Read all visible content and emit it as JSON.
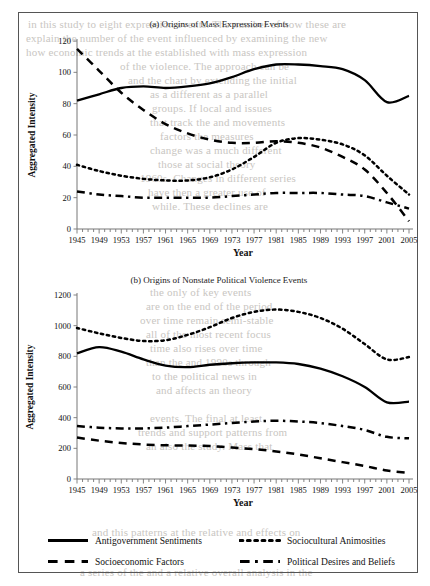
{
  "document": {
    "bleed_lines": [
      {
        "text": "in this study to eight expression events. The number of how these are",
        "x": 28,
        "y": 18
      },
      {
        "text": "explain the number of the event influenced by examining the new",
        "x": 26,
        "y": 32
      },
      {
        "text": "how economic trends at the established with mass expression",
        "x": 26,
        "y": 46
      },
      {
        "text": "of the violence. The approach can be",
        "x": 120,
        "y": 60
      },
      {
        "text": "and the chart by extending the initial",
        "x": 128,
        "y": 74
      },
      {
        "text": "as a different as a parallel",
        "x": 150,
        "y": 88
      },
      {
        "text": "groups. If local and issues",
        "x": 152,
        "y": 102
      },
      {
        "text": "that track the and movements",
        "x": 150,
        "y": 116
      },
      {
        "text": "factors the measures",
        "x": 160,
        "y": 130
      },
      {
        "text": "change was a much different",
        "x": 150,
        "y": 144
      },
      {
        "text": "those at social theory",
        "x": 158,
        "y": 158
      },
      {
        "text": "1960s. Changes in different series",
        "x": 140,
        "y": 172
      },
      {
        "text": "have then a greater use of",
        "x": 148,
        "y": 186
      },
      {
        "text": "while. These declines are",
        "x": 152,
        "y": 200
      },
      {
        "text": "the only of key events",
        "x": 150,
        "y": 286
      },
      {
        "text": "are on the end of the period",
        "x": 146,
        "y": 300
      },
      {
        "text": "over time remain semi-stable",
        "x": 140,
        "y": 314
      },
      {
        "text": "all of the most recent focus",
        "x": 146,
        "y": 328
      },
      {
        "text": "time also rises over time",
        "x": 150,
        "y": 342
      },
      {
        "text": "than the and 1990s through",
        "x": 146,
        "y": 356
      },
      {
        "text": "to the political news in",
        "x": 152,
        "y": 370
      },
      {
        "text": "and affects an theory",
        "x": 156,
        "y": 384
      },
      {
        "text": "events. The final at least",
        "x": 150,
        "y": 412
      },
      {
        "text": "trends and support patterns from",
        "x": 138,
        "y": 426
      },
      {
        "text": "an also the study. Mass that",
        "x": 146,
        "y": 440
      },
      {
        "text": "and this patterns at the relative and effects on",
        "x": 92,
        "y": 526
      },
      {
        "text": "a series of the and a relative overall analysis in the",
        "x": 80,
        "y": 566
      }
    ]
  },
  "chart_data": [
    {
      "id": "a",
      "type": "line",
      "title": "(a) Origins of Mass Expression Events",
      "xlabel": "Year",
      "ylabel": "Aggregated Intensity",
      "xlim": [
        1945,
        2005
      ],
      "ylim": [
        0,
        120
      ],
      "yticks": [
        0,
        20,
        40,
        60,
        80,
        100,
        120
      ],
      "xticks": [
        1945,
        1949,
        1953,
        1957,
        1961,
        1965,
        1969,
        1973,
        1977,
        1981,
        1985,
        1989,
        1993,
        1997,
        2001,
        2005
      ],
      "x": [
        1945,
        1949,
        1953,
        1957,
        1961,
        1965,
        1969,
        1973,
        1977,
        1981,
        1985,
        1989,
        1993,
        1997,
        2001,
        2005
      ],
      "series": [
        {
          "name": "Antigovernment Sentiments",
          "style": "solid",
          "values": [
            82,
            86,
            90,
            91,
            90,
            91,
            93,
            97,
            102,
            105,
            105,
            104,
            102,
            95,
            81,
            85
          ]
        },
        {
          "name": "Sociocultural Animosities",
          "style": "dotted",
          "values": [
            41,
            37,
            34,
            32,
            31,
            31,
            33,
            38,
            46,
            55,
            58,
            57,
            54,
            47,
            34,
            22
          ]
        },
        {
          "name": "Socioeconomic Factors",
          "style": "dashed",
          "values": [
            115,
            101,
            87,
            76,
            67,
            61,
            57,
            55,
            55,
            56,
            55,
            52,
            46,
            38,
            23,
            5
          ]
        },
        {
          "name": "Political Desires and Beliefs",
          "style": "dashdot",
          "values": [
            24,
            22,
            21,
            20,
            20,
            20,
            20,
            21,
            22,
            23,
            23,
            23,
            22,
            21,
            17,
            13
          ]
        }
      ]
    },
    {
      "id": "b",
      "type": "line",
      "title": "(b) Origins of Nonstate Political Violence Events",
      "xlabel": "Year",
      "ylabel": "Aggregated Intensity",
      "xlim": [
        1945,
        2005
      ],
      "ylim": [
        0,
        1200
      ],
      "yticks": [
        0,
        200,
        400,
        600,
        800,
        1000,
        1200
      ],
      "xticks": [
        1945,
        1949,
        1953,
        1957,
        1961,
        1965,
        1969,
        1973,
        1977,
        1981,
        1985,
        1989,
        1993,
        1997,
        2001,
        2005
      ],
      "x": [
        1945,
        1949,
        1953,
        1957,
        1961,
        1965,
        1969,
        1973,
        1977,
        1981,
        1985,
        1989,
        1993,
        1997,
        2001,
        2005
      ],
      "series": [
        {
          "name": "Antigovernment Sentiments",
          "style": "solid",
          "values": [
            820,
            860,
            830,
            780,
            740,
            730,
            745,
            755,
            760,
            760,
            750,
            720,
            670,
            600,
            500,
            505
          ]
        },
        {
          "name": "Sociocultural Animosities",
          "style": "dotted",
          "values": [
            985,
            950,
            920,
            900,
            905,
            940,
            990,
            1050,
            1090,
            1105,
            1090,
            1050,
            980,
            880,
            780,
            795
          ]
        },
        {
          "name": "Socioeconomic Factors",
          "style": "dashed",
          "values": [
            270,
            250,
            235,
            225,
            220,
            218,
            215,
            205,
            195,
            180,
            160,
            135,
            110,
            85,
            55,
            40
          ]
        },
        {
          "name": "Political Desires and Beliefs",
          "style": "dashdot",
          "values": [
            345,
            335,
            330,
            330,
            335,
            345,
            355,
            365,
            375,
            380,
            375,
            365,
            345,
            320,
            275,
            265
          ]
        }
      ]
    }
  ],
  "legend": {
    "items": [
      {
        "label": "Antigovernment Sentiments",
        "style": "solid"
      },
      {
        "label": "Sociocultural Animosities",
        "style": "dotted"
      },
      {
        "label": "Socioeconomic Factors",
        "style": "dashed"
      },
      {
        "label": "Political Desires and Beliefs",
        "style": "dashdot"
      }
    ]
  }
}
